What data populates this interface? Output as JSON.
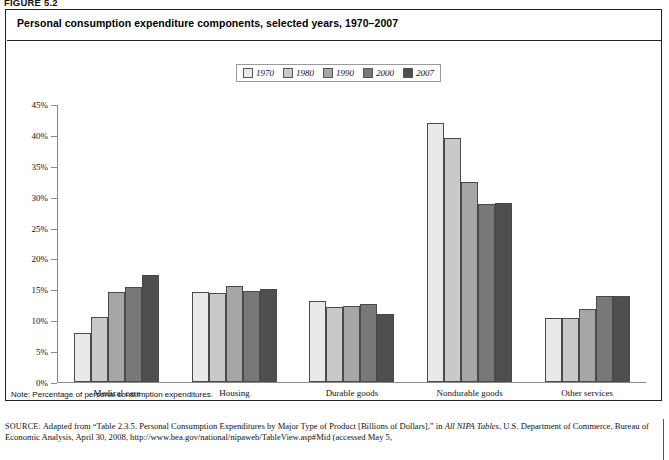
{
  "figure_label": "FIGURE 5.2",
  "chart_title": "Personal consumption expenditure components, selected years, 1970–2007",
  "note": "Note: Percentage of personal consumption expenditures.",
  "source_prefix": "SOURCE:",
  "source_text_1": " Adapted from “Table 2.3.5. Personal Consumption Expenditures by Major Type of Product [Billions of Dollars],” in ",
  "source_italic_1": "All NIPA Tables",
  "source_text_2": ", U.S. Department of Commerce, Bureau of Economic Analysis, April 30, 2008, http://www.bea.gov/national/nipaweb/TableView.asp#Mid (accessed May 5,",
  "colors": {
    "series_1970": "#e9e9e9",
    "series_1980": "#c9c9c9",
    "series_1990": "#a6a6a6",
    "series_2000": "#787878",
    "series_2007": "#4f4f4f",
    "axis": "#8a8a8a",
    "border": "#222222",
    "bar_outline": "#4a4a4a"
  },
  "chart_data": {
    "type": "bar",
    "title": "Personal consumption expenditure components, selected years, 1970–2007",
    "xlabel": "",
    "ylabel": "",
    "ylim": [
      0,
      45
    ],
    "ytick_step": 5,
    "ytick_labels": [
      "45%",
      "40%",
      "35%",
      "30%",
      "25%",
      "20%",
      "15%",
      "10%",
      "5%",
      "0%"
    ],
    "ytick_values": [
      45,
      40,
      35,
      30,
      25,
      20,
      15,
      10,
      5,
      0
    ],
    "grid": false,
    "legend_position": "top-center",
    "categories": [
      "Medical care",
      "Housing",
      "Durable goods",
      "Nondurable goods",
      "Other services"
    ],
    "series": [
      {
        "name": "1970",
        "color": "#e9e9e9",
        "values": [
          8.0,
          14.5,
          13.1,
          42.0,
          10.4
        ]
      },
      {
        "name": "1980",
        "color": "#c9c9c9",
        "values": [
          10.5,
          14.4,
          12.1,
          39.5,
          10.4
        ]
      },
      {
        "name": "1990",
        "color": "#a6a6a6",
        "values": [
          14.5,
          15.5,
          12.3,
          32.3,
          11.8
        ]
      },
      {
        "name": "2000",
        "color": "#787878",
        "values": [
          15.3,
          14.8,
          12.7,
          28.8,
          13.9
        ]
      },
      {
        "name": "2007",
        "color": "#4f4f4f",
        "values": [
          17.3,
          15.1,
          11.0,
          29.0,
          13.9
        ]
      }
    ]
  }
}
